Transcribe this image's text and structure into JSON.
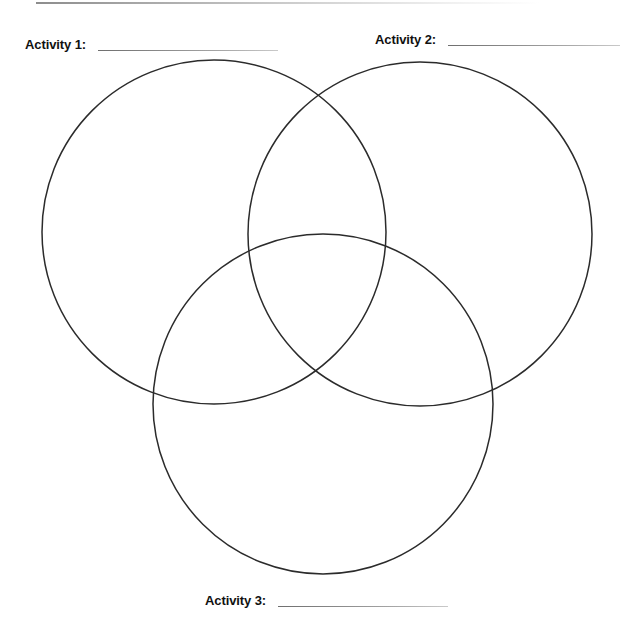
{
  "page": {
    "background_color": "#ffffff",
    "width": 644,
    "height": 632
  },
  "top_rule": {
    "color": "#8d8d8d"
  },
  "labels": [
    {
      "id": "activity-1",
      "text": "Activity 1:",
      "answer_value": "",
      "answer_placeholder": "",
      "x": 25,
      "y": 38
    },
    {
      "id": "activity-2",
      "text": "Activity 2:",
      "answer_value": "",
      "answer_placeholder": "",
      "x": 375,
      "y": 33
    },
    {
      "id": "activity-3",
      "text": "Activity 3:",
      "answer_value": "",
      "answer_placeholder": "",
      "x": 205,
      "y": 594
    }
  ],
  "chart_data": {
    "type": "diagram",
    "diagram_type": "venn",
    "title": "",
    "set_count": 3,
    "stroke_color": "#2b2b2b",
    "stroke_width": 1.5,
    "fill": "none",
    "sets": [
      {
        "name": "Activity 1",
        "label": "Activity 1:",
        "cx": 214,
        "cy": 232,
        "r": 172,
        "position": "top-left",
        "items": []
      },
      {
        "name": "Activity 2",
        "label": "Activity 2:",
        "cx": 420,
        "cy": 234,
        "r": 172,
        "position": "top-right",
        "items": []
      },
      {
        "name": "Activity 3",
        "label": "Activity 3:",
        "cx": 323,
        "cy": 404,
        "r": 170,
        "position": "bottom",
        "items": []
      }
    ],
    "regions": [
      {
        "id": "only-1",
        "sets": [
          "Activity 1"
        ],
        "items": []
      },
      {
        "id": "only-2",
        "sets": [
          "Activity 2"
        ],
        "items": []
      },
      {
        "id": "only-3",
        "sets": [
          "Activity 3"
        ],
        "items": []
      },
      {
        "id": "1-and-2",
        "sets": [
          "Activity 1",
          "Activity 2"
        ],
        "items": []
      },
      {
        "id": "1-and-3",
        "sets": [
          "Activity 1",
          "Activity 3"
        ],
        "items": []
      },
      {
        "id": "2-and-3",
        "sets": [
          "Activity 2",
          "Activity 3"
        ],
        "items": []
      },
      {
        "id": "all",
        "sets": [
          "Activity 1",
          "Activity 2",
          "Activity 3"
        ],
        "items": []
      }
    ]
  }
}
